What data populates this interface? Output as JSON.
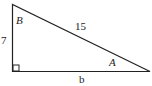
{
  "diagram": {
    "type": "right-triangle",
    "labels": {
      "vertical_side": "7",
      "hypotenuse": "15",
      "horizontal_side": "b",
      "angle_top": "B",
      "angle_right": "A"
    },
    "right_angle_marker": "bottom-left",
    "stroke_color": "#222222"
  }
}
